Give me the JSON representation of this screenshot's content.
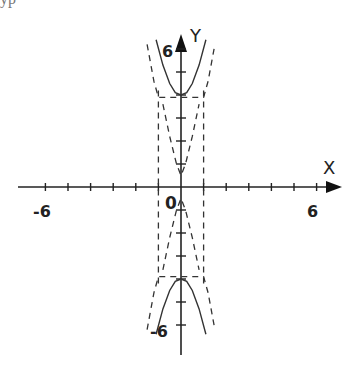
{
  "header": {
    "clipped_text": "ур"
  },
  "chart_data": {
    "type": "line",
    "title": "",
    "xlabel": "X",
    "ylabel": "Y",
    "xlim": [
      -7,
      7
    ],
    "ylim": [
      -7,
      7
    ],
    "x_ticks": [
      -6,
      -5,
      -4,
      -3,
      -2,
      -1,
      1,
      2,
      3,
      4,
      5,
      6
    ],
    "y_ticks": [
      -6,
      -5,
      -4,
      -3,
      -2,
      -1,
      1,
      2,
      3,
      4,
      5,
      6
    ],
    "tick_labels": {
      "x_neg": "-6",
      "x_pos": "6",
      "y_pos": "6",
      "y_neg": "-6",
      "origin": "0"
    },
    "grid": false,
    "legend": null,
    "series": [
      {
        "name": "upper branch (solid)",
        "style": "solid",
        "x": [
          -1.1,
          -0.8,
          -0.5,
          -0.25,
          0,
          0.25,
          0.5,
          0.8,
          1.1
        ],
        "y": [
          6.4,
          5.3,
          4.5,
          4.1,
          4.0,
          4.1,
          4.5,
          5.3,
          6.4
        ]
      },
      {
        "name": "lower branch (solid)",
        "style": "solid",
        "x": [
          -1.1,
          -0.8,
          -0.5,
          -0.25,
          0,
          0.25,
          0.5,
          0.8,
          1.1
        ],
        "y": [
          -6.4,
          -5.3,
          -4.5,
          -4.1,
          -4.0,
          -4.1,
          -4.5,
          -5.3,
          -6.4
        ]
      },
      {
        "name": "vertical asymptote left (dashed)",
        "style": "dashed",
        "x": [
          -1,
          -1
        ],
        "y": [
          -4.2,
          4.2
        ]
      },
      {
        "name": "vertical asymptote right (dashed)",
        "style": "dashed",
        "x": [
          1,
          1
        ],
        "y": [
          -4.2,
          4.2
        ]
      },
      {
        "name": "outer bound upper (dashed)",
        "style": "dashed",
        "x": [
          -1.5,
          -1.2,
          -1.0,
          1.0,
          1.2,
          1.5
        ],
        "y": [
          6.2,
          4.6,
          3.9,
          3.9,
          4.6,
          6.2
        ]
      },
      {
        "name": "outer bound lower (dashed)",
        "style": "dashed",
        "x": [
          -1.5,
          -1.2,
          -1.0,
          1.0,
          1.2,
          1.5
        ],
        "y": [
          -6.2,
          -4.6,
          -3.9,
          -3.9,
          -4.6,
          -6.2
        ]
      },
      {
        "name": "inner bound (dashed)",
        "style": "dashed",
        "x": [
          -0.8,
          -0.5,
          -0.2,
          0,
          0.2,
          0.5,
          0.8
        ],
        "y": [
          3.6,
          2.2,
          1.0,
          0.5,
          1.0,
          2.2,
          3.6
        ]
      },
      {
        "name": "inner bound lower (dashed)",
        "style": "dashed",
        "x": [
          -0.8,
          -0.5,
          -0.2,
          0,
          0.2,
          0.5,
          0.8
        ],
        "y": [
          -3.6,
          -2.2,
          -1.0,
          -0.5,
          -1.0,
          -2.2,
          -3.6
        ]
      }
    ]
  }
}
